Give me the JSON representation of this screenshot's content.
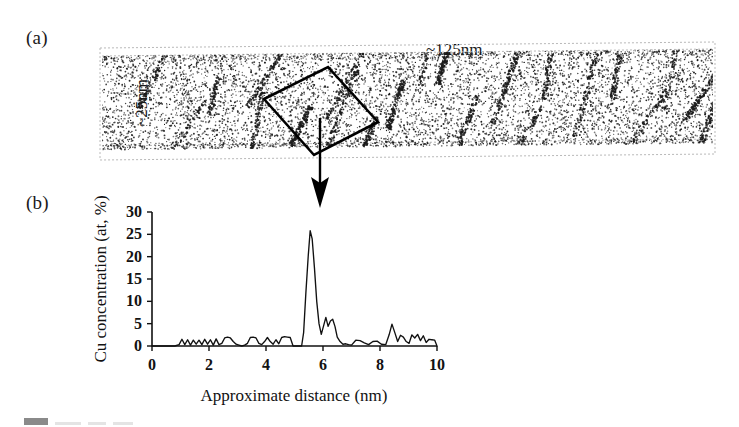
{
  "figure": {
    "panel_a": {
      "label": "(a)",
      "top_dimension": "~125nm",
      "left_dimension": "~25nm",
      "description": "atom-probe-tomography-reconstruction-with-selected-volume-box"
    },
    "panel_b": {
      "label": "(b)"
    },
    "link_arrow": "arrow-from-selected-box-to-concentration-profile"
  },
  "chart_data": {
    "type": "line",
    "title": "",
    "xlabel": "Approximate distance (nm)",
    "ylabel": "Cu concentration (at, %)",
    "xlim": [
      0,
      10
    ],
    "ylim": [
      0,
      30
    ],
    "xticks": [
      0,
      2,
      4,
      6,
      8,
      10
    ],
    "yticks": [
      0,
      5,
      10,
      15,
      20,
      25,
      30
    ],
    "xtick_labels": [
      "0",
      "2",
      "4",
      "6",
      "8",
      "10"
    ],
    "ytick_labels": [
      "0",
      "5",
      "10",
      "15",
      "20",
      "25",
      "30"
    ],
    "grid": false,
    "legend": false,
    "series": [
      {
        "name": "Cu concentration",
        "color": "#111111",
        "x": [
          0.0,
          0.3,
          0.6,
          0.8,
          0.95,
          1.05,
          1.15,
          1.25,
          1.35,
          1.45,
          1.55,
          1.65,
          1.75,
          1.85,
          1.95,
          2.05,
          2.15,
          2.25,
          2.35,
          2.45,
          2.55,
          2.65,
          2.75,
          2.85,
          2.95,
          3.05,
          3.15,
          3.25,
          3.35,
          3.45,
          3.55,
          3.65,
          3.75,
          3.85,
          3.95,
          4.05,
          4.15,
          4.25,
          4.35,
          4.45,
          4.55,
          4.65,
          4.75,
          4.85,
          4.95,
          5.05,
          5.15,
          5.25,
          5.32,
          5.4,
          5.48,
          5.55,
          5.62,
          5.7,
          5.78,
          5.86,
          5.94,
          6.02,
          6.1,
          6.18,
          6.26,
          6.34,
          6.42,
          6.5,
          6.6,
          6.7,
          6.8,
          6.9,
          7.0,
          7.15,
          7.3,
          7.45,
          7.6,
          7.75,
          7.9,
          8.05,
          8.2,
          8.32,
          8.42,
          8.52,
          8.62,
          8.72,
          8.82,
          8.92,
          9.02,
          9.12,
          9.22,
          9.32,
          9.42,
          9.52,
          9.62,
          9.72,
          9.82,
          9.92,
          10.0
        ],
        "y": [
          0.0,
          0.0,
          0.0,
          0.0,
          0.3,
          1.5,
          0.3,
          1.4,
          0.2,
          1.3,
          0.4,
          1.3,
          0.3,
          1.5,
          0.4,
          1.4,
          0.2,
          1.6,
          0.3,
          0.6,
          1.8,
          2.0,
          1.8,
          1.0,
          0.4,
          0.2,
          0.0,
          0.2,
          0.6,
          1.9,
          2.0,
          1.8,
          0.6,
          0.3,
          1.0,
          1.9,
          1.0,
          0.4,
          1.4,
          0.5,
          1.9,
          2.1,
          2.0,
          1.9,
          0.0,
          0.0,
          0.0,
          0.0,
          3.0,
          12.0,
          20.0,
          25.8,
          24.0,
          17.5,
          10.0,
          5.0,
          2.6,
          4.5,
          6.4,
          4.4,
          5.6,
          6.0,
          4.4,
          2.0,
          1.0,
          0.4,
          0.5,
          0.3,
          0.2,
          1.3,
          1.2,
          0.7,
          0.3,
          1.0,
          1.1,
          0.4,
          0.3,
          2.5,
          4.9,
          3.0,
          1.0,
          2.4,
          2.0,
          1.0,
          0.6,
          2.5,
          1.8,
          2.6,
          1.2,
          2.3,
          0.8,
          1.5,
          1.4,
          1.3,
          0.0
        ]
      }
    ]
  }
}
